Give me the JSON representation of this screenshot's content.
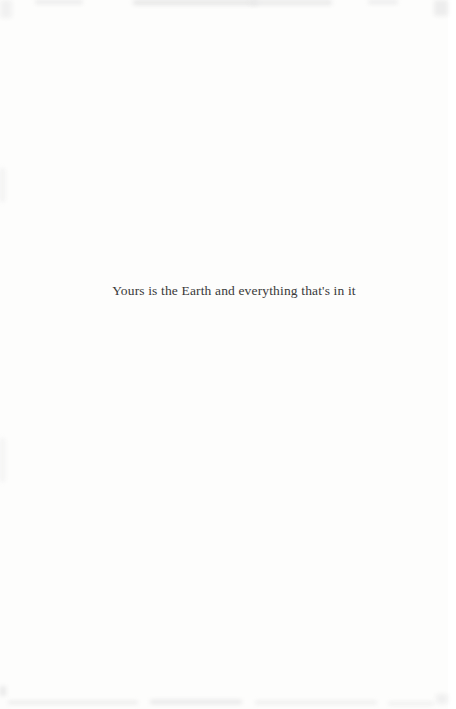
{
  "page": {
    "quote": "Yours is the Earth and everything that's in it",
    "background_color": "#fdfdfc",
    "text_color": "#3a3a3a"
  }
}
